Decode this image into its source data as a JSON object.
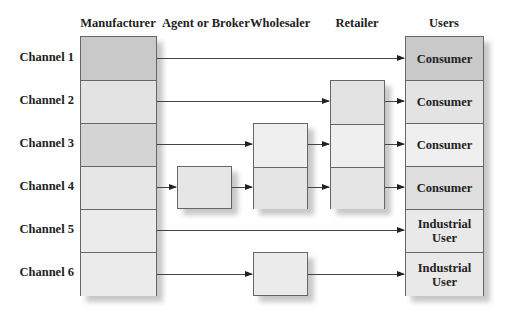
{
  "columns": {
    "manufacturer": "Manufacturer",
    "agent": "Agent or Broker",
    "wholesaler": "Wholesaler",
    "retailer": "Retailer",
    "users": "Users"
  },
  "channels": [
    {
      "label": "Channel 1",
      "path": [
        "Manufacturer",
        "Consumer"
      ],
      "user": "Consumer"
    },
    {
      "label": "Channel 2",
      "path": [
        "Manufacturer",
        "Retailer",
        "Consumer"
      ],
      "user": "Consumer"
    },
    {
      "label": "Channel 3",
      "path": [
        "Manufacturer",
        "Wholesaler",
        "Retailer",
        "Consumer"
      ],
      "user": "Consumer"
    },
    {
      "label": "Channel 4",
      "path": [
        "Manufacturer",
        "Agent or Broker",
        "Wholesaler",
        "Retailer",
        "Consumer"
      ],
      "user": "Consumer"
    },
    {
      "label": "Channel 5",
      "path": [
        "Manufacturer",
        "Industrial User"
      ],
      "user_line1": "Industrial",
      "user_line2": "User"
    },
    {
      "label": "Channel 6",
      "path": [
        "Manufacturer",
        "Wholesaler",
        "Industrial User"
      ],
      "user_line1": "Industrial",
      "user_line2": "User"
    }
  ],
  "colors": {
    "dark_cell": "#c9c9c9",
    "mid_cell": "#dcdcdc",
    "light_cell": "#e9e9e9",
    "lightest_cell": "#efefef",
    "border": "#666666",
    "arrow": "#333333"
  }
}
